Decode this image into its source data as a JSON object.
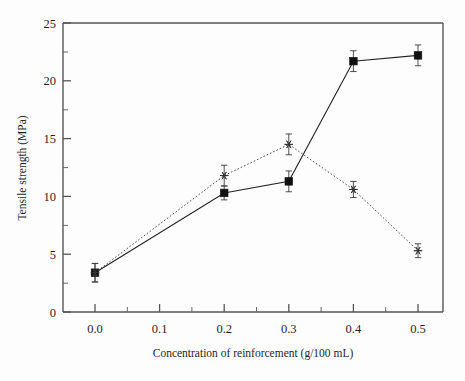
{
  "chart_data": {
    "type": "line",
    "title": "",
    "xlabel": "Concentration of reinforcement (g/100 mL)",
    "ylabel": "Tensile strength (MPa)",
    "xlim": [
      -0.03,
      0.53
    ],
    "ylim": [
      0,
      25
    ],
    "xticks": [
      "0.0",
      "0.1",
      "0.2",
      "0.3",
      "0.4",
      "0.5"
    ],
    "xtick_values": [
      0.0,
      0.1,
      0.2,
      0.3,
      0.4,
      0.5
    ],
    "yticks": [
      "0",
      "5",
      "10",
      "15",
      "20",
      "25"
    ],
    "ytick_values": [
      0,
      5,
      10,
      15,
      20,
      25
    ],
    "minor_ticks": true,
    "grid": false,
    "legend": "none",
    "x": [
      0.0,
      0.2,
      0.3,
      0.4,
      0.5
    ],
    "series": [
      {
        "name": "solid-square-series",
        "marker": "filled-square",
        "linestyle": "solid",
        "values": [
          3.4,
          10.3,
          11.3,
          21.7,
          22.2
        ],
        "errors": [
          0.8,
          0.6,
          0.9,
          0.9,
          0.9
        ]
      },
      {
        "name": "dotted-star-series",
        "marker": "star",
        "linestyle": "dotted",
        "values": [
          3.4,
          11.8,
          14.5,
          10.6,
          5.3
        ],
        "errors": [
          0.8,
          0.9,
          0.9,
          0.7,
          0.6
        ]
      }
    ]
  }
}
